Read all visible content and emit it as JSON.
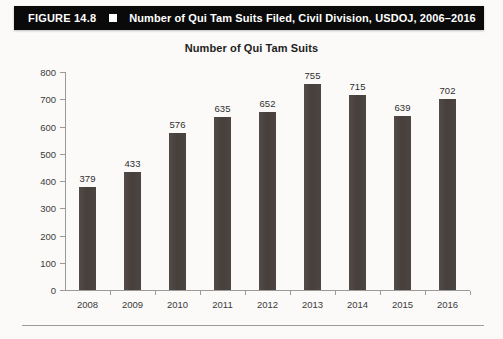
{
  "figure": {
    "number": "FIGURE 14.8",
    "separator_icon": "white-square-icon",
    "caption": "Number of Qui Tam Suits Filed, Civil Division, USDOJ, 2006–2016",
    "bar_color": "#0a0a0a",
    "text_color": "#ffffff"
  },
  "chart_data": {
    "type": "bar",
    "title": "Number of Qui Tam Suits",
    "xlabel": "",
    "ylabel": "",
    "categories": [
      "2008",
      "2009",
      "2010",
      "2011",
      "2012",
      "2013",
      "2014",
      "2015",
      "2016"
    ],
    "values": [
      379,
      433,
      576,
      635,
      652,
      755,
      715,
      639,
      702
    ],
    "data_labels": [
      "379",
      "433",
      "576",
      "635",
      "652",
      "755",
      "715",
      "639",
      "702"
    ],
    "ylim": [
      0,
      800
    ],
    "yticks": [
      0,
      100,
      200,
      300,
      400,
      500,
      600,
      700,
      800
    ],
    "ytick_labels": [
      "0",
      "100",
      "200",
      "300",
      "400",
      "500",
      "600",
      "700",
      "800"
    ],
    "grid": false,
    "legend": false,
    "series": [
      {
        "name": "Qui Tam Suits",
        "values": [
          379,
          433,
          576,
          635,
          652,
          755,
          715,
          639,
          702
        ],
        "color": "#4b4340"
      }
    ]
  },
  "page": {
    "background_color": "#fbfaf8",
    "rule_color": "#9d9d9b"
  }
}
